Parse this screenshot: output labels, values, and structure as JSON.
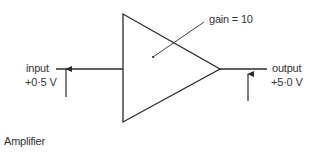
{
  "diagram": {
    "type": "amplifier-block",
    "caption": "Amplifier",
    "gain_label": "gain = 10",
    "input": {
      "label": "input",
      "value": "+0·5 V"
    },
    "output": {
      "label": "output",
      "value": "+5·0 V"
    },
    "stroke_color": "#2a2a2a"
  }
}
